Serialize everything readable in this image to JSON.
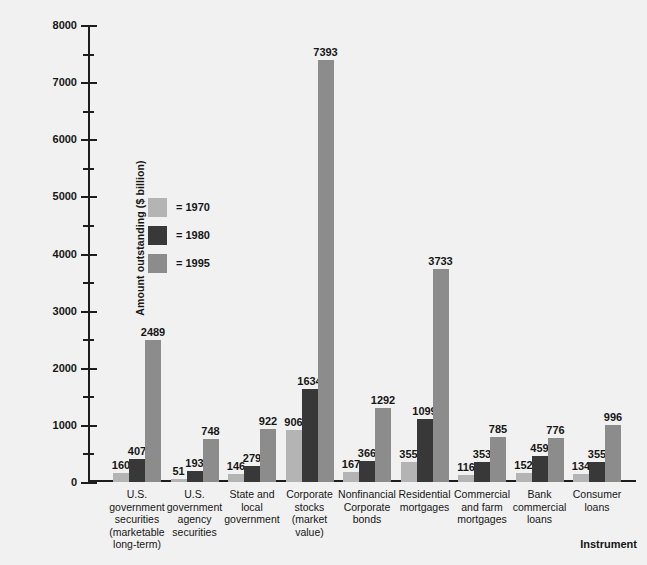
{
  "chart_data": {
    "type": "bar",
    "title": "",
    "xlabel": "Instrument",
    "ylabel": "Amount outstanding ($ billion)",
    "ylim": [
      0,
      8000
    ],
    "ytick_labels": [
      "0",
      "1000",
      "2000",
      "3000",
      "4000",
      "5000",
      "6000",
      "7000",
      "8000"
    ],
    "ytick_values": [
      0,
      1000,
      2000,
      3000,
      4000,
      5000,
      6000,
      7000,
      8000
    ],
    "minor_tick_step": 500,
    "grid": false,
    "legend_position": "inside-left",
    "categories": [
      "U.S.\ngovernment\nsecurities\n(marketable\nlong-term)",
      "U.S.\ngovernment\nagency\nsecurities",
      "State and\nlocal\ngovernment",
      "Corporate\nstocks\n(market\nvalue)",
      "Nonfinancial\nCorporate\nbonds",
      "Residential\nmortgages",
      "Commercial\nand farm\nmortgages",
      "Bank\ncommercial\nloans",
      "Consumer\nloans"
    ],
    "series": [
      {
        "name": "= 1970",
        "color": "#b4b4b4",
        "values": [
          160,
          51,
          146,
          906,
          167,
          355,
          116,
          152,
          134
        ]
      },
      {
        "name": "= 1980",
        "color": "#383838",
        "values": [
          407,
          193,
          279,
          1634,
          366,
          1099,
          353,
          459,
          355
        ]
      },
      {
        "name": "= 1995",
        "color": "#8c8c8c",
        "values": [
          2489,
          748,
          922,
          7393,
          1292,
          3733,
          785,
          776,
          996
        ]
      }
    ]
  },
  "legend": {
    "items": [
      {
        "label": "= 1970",
        "color": "#b4b4b4"
      },
      {
        "label": "= 1980",
        "color": "#383838"
      },
      {
        "label": "= 1995",
        "color": "#8c8c8c"
      }
    ]
  },
  "axis": {
    "x_title": "Instrument",
    "y_title": "Amount outstanding ($ billion)"
  },
  "colors": {
    "background": "#f1f1f1",
    "axis": "#1d1d1d",
    "text": "#161616",
    "series_1970": "#b4b4b4",
    "series_1980": "#383838",
    "series_1995": "#8c8c8c"
  }
}
